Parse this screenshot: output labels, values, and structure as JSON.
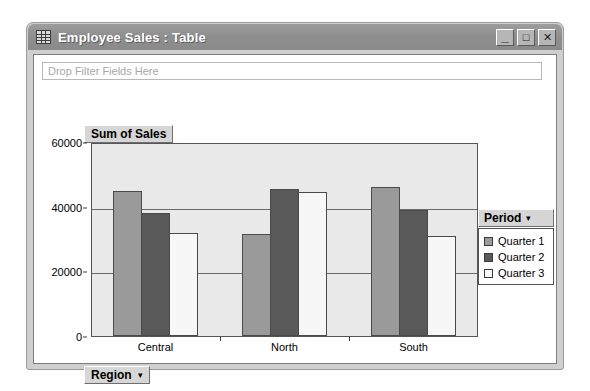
{
  "window": {
    "title": "Employee Sales : Table",
    "icon": "table-grid-icon",
    "controls": {
      "minimize": "_",
      "maximize": "□",
      "close": "✕"
    }
  },
  "filter_area": {
    "placeholder": "Drop Filter Fields Here"
  },
  "field_buttons": {
    "value_field": "Sum of Sales",
    "row_field": "Region",
    "caret": "▾"
  },
  "legend": {
    "title": "Period",
    "caret": "▾",
    "items": [
      {
        "label": "Quarter 1",
        "color": "#9a9a9a"
      },
      {
        "label": "Quarter 2",
        "color": "#595959"
      },
      {
        "label": "Quarter 3",
        "color": "#f7f7f7"
      }
    ]
  },
  "chart_data": {
    "type": "bar",
    "title": "Sum of Sales",
    "xlabel": "Region",
    "ylabel": "",
    "categories": [
      "Central",
      "North",
      "South"
    ],
    "series": [
      {
        "name": "Quarter 1",
        "color": "#9a9a9a",
        "values": [
          45000,
          31500,
          46000
        ]
      },
      {
        "name": "Quarter 2",
        "color": "#595959",
        "values": [
          38000,
          45500,
          39000
        ]
      },
      {
        "name": "Quarter 3",
        "color": "#f7f7f7",
        "values": [
          32000,
          44500,
          31000
        ]
      }
    ],
    "ylim": [
      0,
      60000
    ],
    "yticks": [
      0,
      20000,
      40000,
      60000
    ],
    "ytick_labels": [
      "0",
      "20000",
      "40000",
      "60000"
    ],
    "grid": true,
    "legend_position": "right",
    "plot_background": "#e9e9e9"
  }
}
